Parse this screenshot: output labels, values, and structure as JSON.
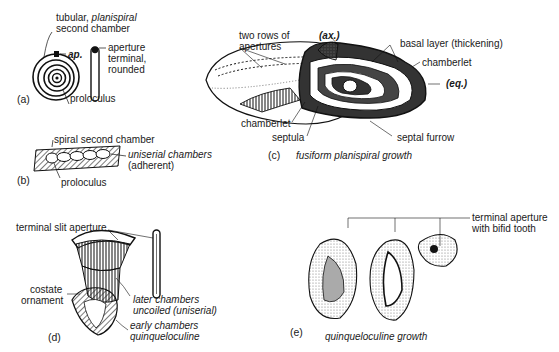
{
  "figure": {
    "panels": [
      {
        "id": "a",
        "label": "(a)",
        "annotations": {
          "chamber_prefix": "tubular,",
          "chamber_italic": "planispiral",
          "chamber_line2": "second chamber",
          "aperture_abbr": "ap.",
          "aperture_line1": "aperture",
          "aperture_line2": "terminal,",
          "aperture_line3": "rounded",
          "proloculus": "proloculus"
        }
      },
      {
        "id": "b",
        "label": "(b)",
        "annotations": {
          "spiral": "spiral second chamber",
          "uniserial_line1": "uniserial chambers",
          "uniserial_line2": "(adherent)",
          "proloculus": "proloculus"
        }
      },
      {
        "id": "c",
        "label": "(c)",
        "caption": "fusiform planispiral growth",
        "annotations": {
          "two_rows_line1": "two rows of",
          "two_rows_line2": "apertures",
          "axial": "(ax.)",
          "basal_layer": "basal layer (thickening)",
          "chamberlet_right": "chamberlet",
          "equatorial": "(eq.)",
          "chamberlet_left": "chamberlet",
          "septula": "septula",
          "septal_furrow": "septal furrow"
        }
      },
      {
        "id": "d",
        "label": "(d)",
        "annotations": {
          "slit_aperture": "terminal slit aperture",
          "costate_line1": "costate",
          "costate_line2": "ornament",
          "later_line1": "later chambers",
          "later_line2": "uncoiled (uniserial)",
          "early_line1": "early chambers",
          "early_line2": "quinqueloculine"
        }
      },
      {
        "id": "e",
        "label": "(e)",
        "caption": "quinqueloculine growth",
        "annotations": {
          "terminal_line1": "terminal aperture",
          "terminal_line2": "with bifid tooth"
        }
      }
    ]
  }
}
